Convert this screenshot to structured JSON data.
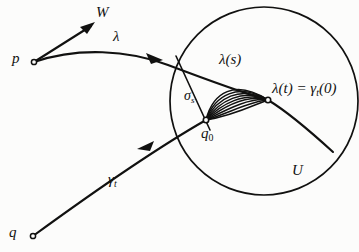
{
  "figure": {
    "kind": "mathematical-diagram",
    "background_color": "#fcfcfb",
    "ink_color": "#111110",
    "width": 359,
    "height": 252
  },
  "labels": {
    "p": "p",
    "q": "q",
    "W": "W",
    "lambda": "λ",
    "lambda_of_s": "λ(s)",
    "lambda_of_t_prefix": "λ(t) = γ",
    "lambda_of_t_subscript": "t",
    "lambda_of_t_suffix": "(0)",
    "sigma_base": "σ",
    "sigma_subscript": "s",
    "q_base": "q",
    "q_subscript": "0",
    "gamma_base": "γ",
    "gamma_subscript": "t",
    "U": "U"
  },
  "points": {
    "p": {
      "x": 34,
      "y": 62,
      "marker": "open-circle"
    },
    "q": {
      "x": 33,
      "y": 236,
      "marker": "open-circle"
    },
    "q0": {
      "x": 206,
      "y": 120,
      "marker": "open-circle"
    },
    "lambda_t": {
      "x": 268,
      "y": 100,
      "marker": "open-circle"
    }
  },
  "circle_U": {
    "cx": 264,
    "cy": 101,
    "r": 94
  },
  "vector_W": {
    "from_x": 34,
    "from_y": 62,
    "to_x": 95,
    "to_y": 23
  },
  "arrowheads": {
    "lambda_curve": {
      "x": 158,
      "y": 58
    },
    "gamma_curve": {
      "x": 148,
      "y": 145
    }
  },
  "geodesic_fan": {
    "from": "q0",
    "to": "lambda_t",
    "strand_count": 9,
    "description": "family of geodesics sigma_s from q0 to lambda(t)"
  }
}
